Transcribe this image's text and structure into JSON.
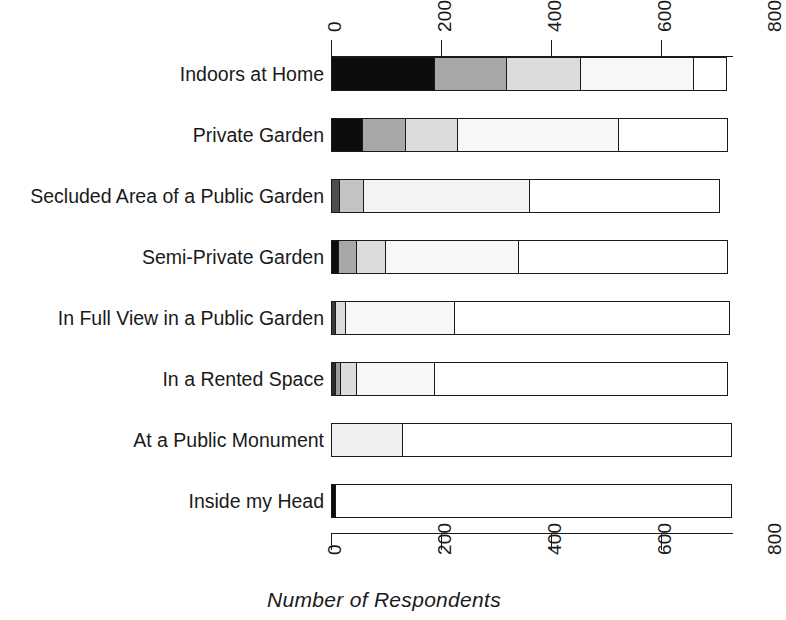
{
  "chart_data": {
    "type": "bar",
    "orientation": "horizontal",
    "stacked": true,
    "title": "",
    "xlabel": "Number of Respondents",
    "ylabel": "",
    "xlim": [
      0,
      800
    ],
    "xticks": [
      0,
      200,
      400,
      600,
      800
    ],
    "xtick_labels": [
      "0",
      "200",
      "400",
      "600",
      "800"
    ],
    "grid": false,
    "legend": "none",
    "axis_top_ticks": [
      "0",
      "200",
      "400",
      "600",
      "800"
    ],
    "axis_bottom_ticks": [
      "0",
      "200",
      "400",
      "600",
      "800"
    ],
    "categories": [
      "Indoors at Home",
      "Private Garden",
      "Secluded Area of a Public Garden",
      "Semi-Private Garden",
      "In Full View in a Public Garden",
      "In a Rented Space",
      "At a Public Monument",
      "Inside my Head"
    ],
    "series": [
      {
        "name": "Response 1",
        "color": "#0d0d0d",
        "values": [
          190,
          59,
          17,
          15,
          10,
          10,
          0,
          10
        ]
      },
      {
        "name": "Response 2",
        "color": "#a8a8a8",
        "values": [
          133,
          80,
          45,
          36,
          20,
          11,
          0,
          0
        ]
      },
      {
        "name": "Response 3",
        "color": "#dcdcdc",
        "values": [
          136,
          98,
          0,
          55,
          0,
          31,
          131,
          0
        ]
      },
      {
        "name": "Response 4",
        "color": "#f4f4f4",
        "values": [
          209,
          295,
          305,
          244,
          200,
          144,
          0,
          0
        ]
      },
      {
        "name": "Response 5",
        "color": "#ffffff",
        "values": [
          62,
          200,
          347,
          382,
          502,
          536,
          601,
          722
        ]
      }
    ],
    "bar_totals": [
      730,
      732,
      714,
      732,
      732,
      732,
      732,
      732
    ],
    "rows": [
      {
        "category": "Indoors at Home",
        "segments": [
          {
            "value": 190,
            "color": "#0d0d0d"
          },
          {
            "value": 133,
            "color": "#a8a8a8"
          },
          {
            "value": 136,
            "color": "#dcdcdc"
          },
          {
            "value": 209,
            "color": "#f7f7f7"
          },
          {
            "value": 62,
            "color": "#ffffff"
          }
        ]
      },
      {
        "category": "Private Garden",
        "segments": [
          {
            "value": 59,
            "color": "#0d0d0d"
          },
          {
            "value": 80,
            "color": "#a8a8a8"
          },
          {
            "value": 98,
            "color": "#dcdcdc"
          },
          {
            "value": 295,
            "color": "#f7f7f7"
          },
          {
            "value": 200,
            "color": "#ffffff"
          }
        ]
      },
      {
        "category": "Secluded Area of a Public Garden",
        "segments": [
          {
            "value": 17,
            "color": "#4d4d4d"
          },
          {
            "value": 45,
            "color": "#c4c4c4"
          },
          {
            "value": 305,
            "color": "#f4f4f4"
          },
          {
            "value": 347,
            "color": "#ffffff"
          }
        ]
      },
      {
        "category": "Semi-Private Garden",
        "segments": [
          {
            "value": 15,
            "color": "#0d0d0d"
          },
          {
            "value": 36,
            "color": "#a8a8a8"
          },
          {
            "value": 55,
            "color": "#dcdcdc"
          },
          {
            "value": 244,
            "color": "#f7f7f7"
          },
          {
            "value": 382,
            "color": "#ffffff"
          }
        ]
      },
      {
        "category": "In Full View in a Public Garden",
        "segments": [
          {
            "value": 10,
            "color": "#3a3a3a"
          },
          {
            "value": 20,
            "color": "#dcdcdc"
          },
          {
            "value": 200,
            "color": "#f7f7f7"
          },
          {
            "value": 502,
            "color": "#ffffff"
          }
        ]
      },
      {
        "category": "In a Rented Space",
        "segments": [
          {
            "value": 10,
            "color": "#2b2b2b"
          },
          {
            "value": 11,
            "color": "#9e9e9e"
          },
          {
            "value": 31,
            "color": "#dcdcdc"
          },
          {
            "value": 144,
            "color": "#f7f7f7"
          },
          {
            "value": 536,
            "color": "#ffffff"
          }
        ]
      },
      {
        "category": "At a Public Monument",
        "segments": [
          {
            "value": 131,
            "color": "#f0f0f0"
          },
          {
            "value": 601,
            "color": "#ffffff"
          }
        ]
      },
      {
        "category": "Inside my Head",
        "segments": [
          {
            "value": 10,
            "color": "#0d0d0d"
          },
          {
            "value": 722,
            "color": "#ffffff"
          }
        ]
      }
    ]
  },
  "axis": {
    "x_title": "Number of Respondents",
    "ticks": [
      "0",
      "200",
      "400",
      "600",
      "800"
    ]
  }
}
